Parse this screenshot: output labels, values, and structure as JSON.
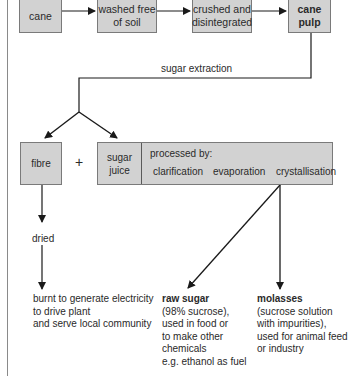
{
  "top_row": [
    {
      "id": "cane",
      "label": "cane",
      "bold": false
    },
    {
      "id": "washed",
      "label_lines": [
        "washed free",
        "of soil"
      ],
      "bold": false
    },
    {
      "id": "crushed",
      "label_lines": [
        "crushed and",
        "disintegrated"
      ],
      "bold": false
    },
    {
      "id": "cane_pulp",
      "label_lines": [
        "cane",
        "pulp"
      ],
      "bold": true
    }
  ],
  "extraction_label": "sugar extraction",
  "fibre": {
    "label": "fibre"
  },
  "plus": "+",
  "sugar_juice": {
    "label_lines": [
      "sugar",
      "juice"
    ]
  },
  "process": {
    "title": "processed by:",
    "steps": [
      "clarification",
      "evaporation",
      "crystallisation"
    ]
  },
  "dried_label": "dried",
  "outputs": {
    "fibre_use": [
      "burnt to generate electricity",
      "to drive plant",
      "and serve local community"
    ],
    "raw_sugar": {
      "head": "raw sugar",
      "lines": [
        "(98% sucrose),",
        "used in food or",
        "to make other",
        "chemicals",
        "e.g. ethanol as fuel"
      ]
    },
    "molasses": {
      "head": "molasses",
      "lines": [
        "(sucrose solution",
        "with impurities),",
        "used for animal feed",
        "or industry"
      ]
    }
  },
  "colors": {
    "box_fill": "#d2d2d2",
    "box_border": "#7a7a7a",
    "line": "#1a1a1a",
    "text": "#2a2a2a"
  }
}
